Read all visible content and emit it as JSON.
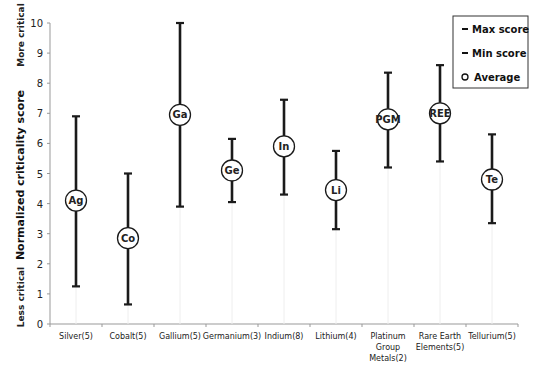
{
  "chart_data": {
    "type": "errorbar",
    "title": "",
    "xlabel": "",
    "ylabel": "Normalized criticality score",
    "ylabel_top_annotation": "More critical",
    "ylabel_bottom_annotation": "Less critical",
    "ylim": [
      0,
      10
    ],
    "yticks": [
      0,
      1,
      2,
      3,
      4,
      5,
      6,
      7,
      8,
      9,
      10
    ],
    "grid": false,
    "legend_position": "top-right",
    "legend": [
      {
        "symbol": "–",
        "label": "Max score"
      },
      {
        "symbol": "–",
        "label": "Min score"
      },
      {
        "symbol": "○",
        "label": "Average"
      }
    ],
    "categories": [
      "Silver(5)",
      "Cobalt(5)",
      "Gallium(5)",
      "Germanium(3)",
      "Indium(8)",
      "Lithium(4)",
      "Platinum Group Metals(2)",
      "Rare Earth Elements(5)",
      "Tellurium(5)"
    ],
    "category_lines": [
      [
        "Silver(5)"
      ],
      [
        "Cobalt(5)"
      ],
      [
        "Gallium(5)"
      ],
      [
        "Germanium(3)"
      ],
      [
        "Indium(8)"
      ],
      [
        "Lithium(4)"
      ],
      [
        "Platinum",
        "Group",
        "Metals(2)"
      ],
      [
        "Rare Earth",
        "Elements(5)"
      ],
      [
        "Tellurium(5)"
      ]
    ],
    "marker_labels": [
      "Ag",
      "Co",
      "Ga",
      "Ge",
      "In",
      "Li",
      "PGM",
      "REE",
      "Te"
    ],
    "series": [
      {
        "name": "Max score",
        "values": [
          6.9,
          5.0,
          10.0,
          6.15,
          7.45,
          5.75,
          8.35,
          8.6,
          6.3
        ]
      },
      {
        "name": "Min score",
        "values": [
          1.25,
          0.65,
          3.9,
          4.05,
          4.3,
          3.15,
          5.2,
          5.4,
          3.35
        ]
      },
      {
        "name": "Average",
        "values": [
          4.1,
          2.85,
          6.95,
          5.1,
          5.9,
          4.45,
          6.8,
          7.0,
          4.8
        ]
      }
    ]
  },
  "colors": {
    "bar": "#1a1a1a",
    "axis": "#999999",
    "marker_fill": "#ffffff",
    "marker_stroke": "#1a1a1a",
    "background": "#ffffff"
  }
}
